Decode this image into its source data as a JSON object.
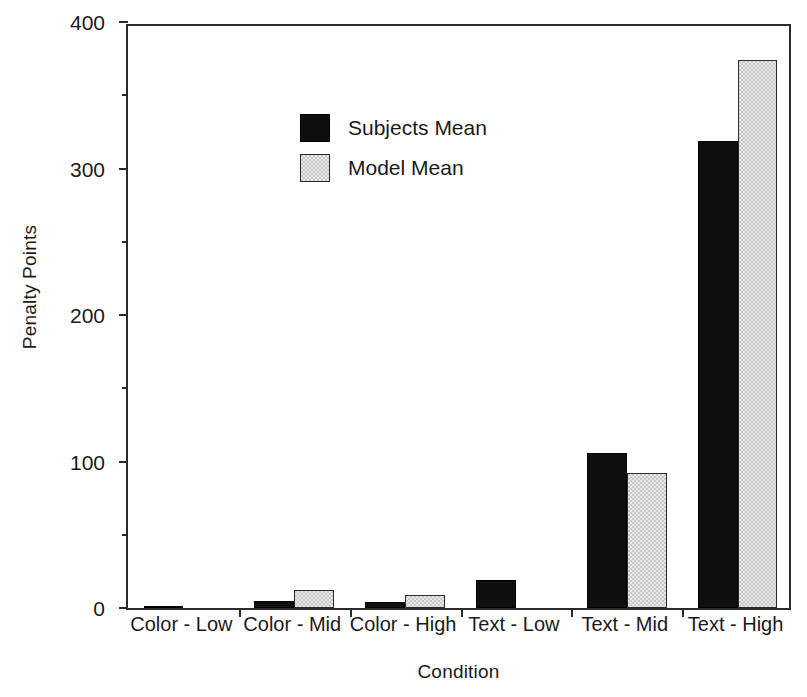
{
  "chart_data": {
    "type": "bar",
    "title": "",
    "xlabel": "Condition",
    "ylabel": "Penalty Points",
    "categories": [
      "Color - Low",
      "Color - Mid",
      "Color - High",
      "Text - Low",
      "Text - Mid",
      "Text - High"
    ],
    "series": [
      {
        "name": "Subjects Mean",
        "color": "#0f0f0f",
        "values": [
          1,
          5,
          4,
          19,
          106,
          319
        ]
      },
      {
        "name": "Model Mean",
        "color": "#c9c9c9",
        "values": [
          0,
          12,
          9,
          0,
          92,
          374
        ]
      }
    ],
    "ylim": [
      0,
      400
    ],
    "ytick_labels": [
      "0",
      "100",
      "200",
      "300",
      "400"
    ],
    "ytick_values": [
      0,
      100,
      200,
      300,
      400
    ],
    "yminor_values": [
      50,
      150,
      250,
      350
    ],
    "grid": false,
    "legend_position": "upper-center-left"
  },
  "legend": {
    "entries": [
      {
        "label": "Subjects Mean"
      },
      {
        "label": "Model Mean"
      }
    ]
  },
  "axes": {
    "y_title": "Penalty Points",
    "x_title": "Condition"
  }
}
